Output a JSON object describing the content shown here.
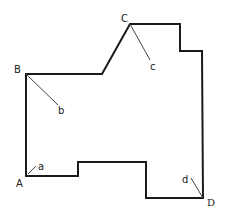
{
  "diagram": {
    "type": "polygon-outline",
    "stroke_color": "#1a1a1a",
    "leader_color": "#444444",
    "outline_points": [
      [
        26,
        74
      ],
      [
        102,
        74
      ],
      [
        130,
        24
      ],
      [
        180,
        24
      ],
      [
        180,
        51
      ],
      [
        202,
        51
      ],
      [
        203,
        198
      ],
      [
        146,
        198
      ],
      [
        146,
        162
      ],
      [
        78,
        162
      ],
      [
        78,
        176
      ],
      [
        26,
        176
      ]
    ],
    "vertices": [
      {
        "id": "A",
        "label": "A",
        "x": 26,
        "y": 176,
        "label_x": 16,
        "label_y": 187,
        "sub_label": "a",
        "sub_label_x": 38,
        "sub_label_y": 170,
        "leader": [
          [
            28,
            174
          ],
          [
            36,
            166
          ]
        ]
      },
      {
        "id": "B",
        "label": "B",
        "x": 26,
        "y": 74,
        "label_x": 14,
        "label_y": 73,
        "sub_label": "b",
        "sub_label_x": 58,
        "sub_label_y": 114,
        "leader": [
          [
            26,
            74
          ],
          [
            58,
            105
          ]
        ]
      },
      {
        "id": "C",
        "label": "C",
        "x": 130,
        "y": 24,
        "label_x": 121,
        "label_y": 22,
        "sub_label": "c",
        "sub_label_x": 150,
        "sub_label_y": 70,
        "leader": [
          [
            130,
            24
          ],
          [
            150,
            60
          ]
        ]
      },
      {
        "id": "D",
        "label": "D",
        "x": 203,
        "y": 198,
        "label_x": 207,
        "label_y": 206,
        "sub_label": "d",
        "sub_label_x": 182,
        "sub_label_y": 183,
        "leader": [
          [
            203,
            198
          ],
          [
            191,
            178
          ]
        ]
      }
    ]
  }
}
